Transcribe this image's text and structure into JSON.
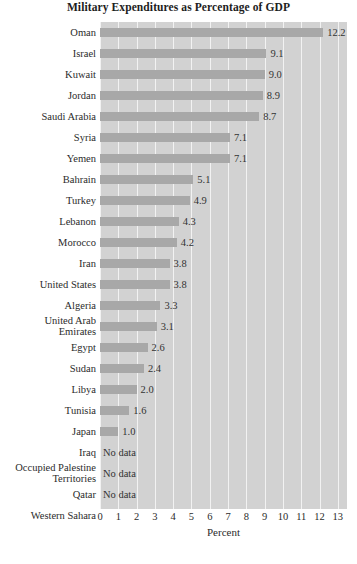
{
  "chart_data": {
    "type": "bar",
    "orientation": "horizontal",
    "title": "Military Expenditures as Percentage of GDP",
    "xlabel": "Percent",
    "ylabel": "",
    "xlim": [
      0,
      13.5
    ],
    "xticks": [
      0,
      1,
      2,
      3,
      4,
      5,
      6,
      7,
      8,
      9,
      10,
      11,
      12,
      13
    ],
    "xtick_labels": [
      "0",
      "1",
      "2",
      "3",
      "4",
      "5",
      "6",
      "7",
      "8",
      "9",
      "10",
      "11",
      "12",
      "13"
    ],
    "grid": "vertical-white-gridlines",
    "legend": "none",
    "plot_background": "#d2d2d2",
    "bar_color": "#a8a8a8",
    "no_data_text": "No data",
    "categories": [
      "Oman",
      "Israel",
      "Kuwait",
      "Jordan",
      "Saudi Arabia",
      "Syria",
      "Yemen",
      "Bahrain",
      "Turkey",
      "Lebanon",
      "Morocco",
      "Iran",
      "United States",
      "Algeria",
      "United Arab Emirates",
      "Egypt",
      "Sudan",
      "Libya",
      "Tunisia",
      "Japan",
      "Iraq",
      "Occupied Palestine Territories",
      "Qatar",
      "Western Sahara"
    ],
    "values": [
      12.2,
      9.1,
      9.0,
      8.9,
      8.7,
      7.1,
      7.1,
      5.1,
      4.9,
      4.3,
      4.2,
      3.8,
      3.8,
      3.3,
      3.1,
      2.6,
      2.4,
      2.0,
      1.6,
      1.0,
      null,
      null,
      null,
      null
    ],
    "value_labels": [
      "12.2",
      "9.1",
      "9.0",
      "8.9",
      "8.7",
      "7.1",
      "7.1",
      "5.1",
      "4.9",
      "4.3",
      "4.2",
      "3.8",
      "3.8",
      "3.3",
      "3.1",
      "2.6",
      "2.4",
      "2.0",
      "1.6",
      "1.0",
      "No data",
      "No data",
      "No data",
      "No data"
    ],
    "category_label_lines": [
      [
        "Oman"
      ],
      [
        "Israel"
      ],
      [
        "Kuwait"
      ],
      [
        "Jordan"
      ],
      [
        "Saudi Arabia"
      ],
      [
        "Syria"
      ],
      [
        "Yemen"
      ],
      [
        "Bahrain"
      ],
      [
        "Turkey"
      ],
      [
        "Lebanon"
      ],
      [
        "Morocco"
      ],
      [
        "Iran"
      ],
      [
        "United States"
      ],
      [
        "Algeria"
      ],
      [
        "United Arab",
        "Emirates"
      ],
      [
        "Egypt"
      ],
      [
        "Sudan"
      ],
      [
        "Libya"
      ],
      [
        "Tunisia"
      ],
      [
        "Japan"
      ],
      [
        "Iraq"
      ],
      [
        "Occupied Palestine",
        "Territories"
      ],
      [
        "Qatar"
      ],
      [
        "Western Sahara"
      ]
    ]
  }
}
